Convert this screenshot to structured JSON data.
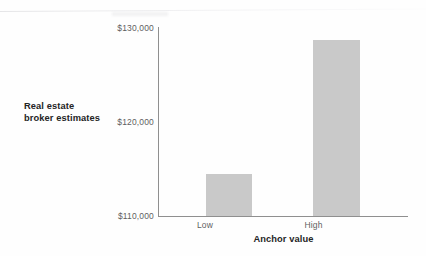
{
  "chart_data": {
    "type": "bar",
    "title": "",
    "categories": [
      "Low",
      "High"
    ],
    "values": [
      114500,
      128700
    ],
    "series": [
      {
        "name": "Real estate broker estimates",
        "values": [
          114500,
          128700
        ]
      }
    ],
    "xlabel": "Anchor value",
    "ylabel": "Real estate broker estimates",
    "ylim": [
      110000,
      130000
    ],
    "yticks": [
      110000,
      120000,
      130000
    ],
    "ytick_labels": [
      "$110,000",
      "$120,000",
      "$130,000"
    ],
    "grid": false,
    "legend": false,
    "legend_position": "none",
    "bar_color": "#c9c9c9",
    "axis_color": "#8f8f8f"
  },
  "axes": {
    "y_title_line1": "Real estate",
    "y_title_line2": "broker estimates",
    "x_title": "Anchor value"
  },
  "ticks": {
    "y": {
      "high": "$130,000",
      "mid": "$120,000",
      "low": "$110,000"
    },
    "x": {
      "first": "Low",
      "second": "High"
    }
  }
}
